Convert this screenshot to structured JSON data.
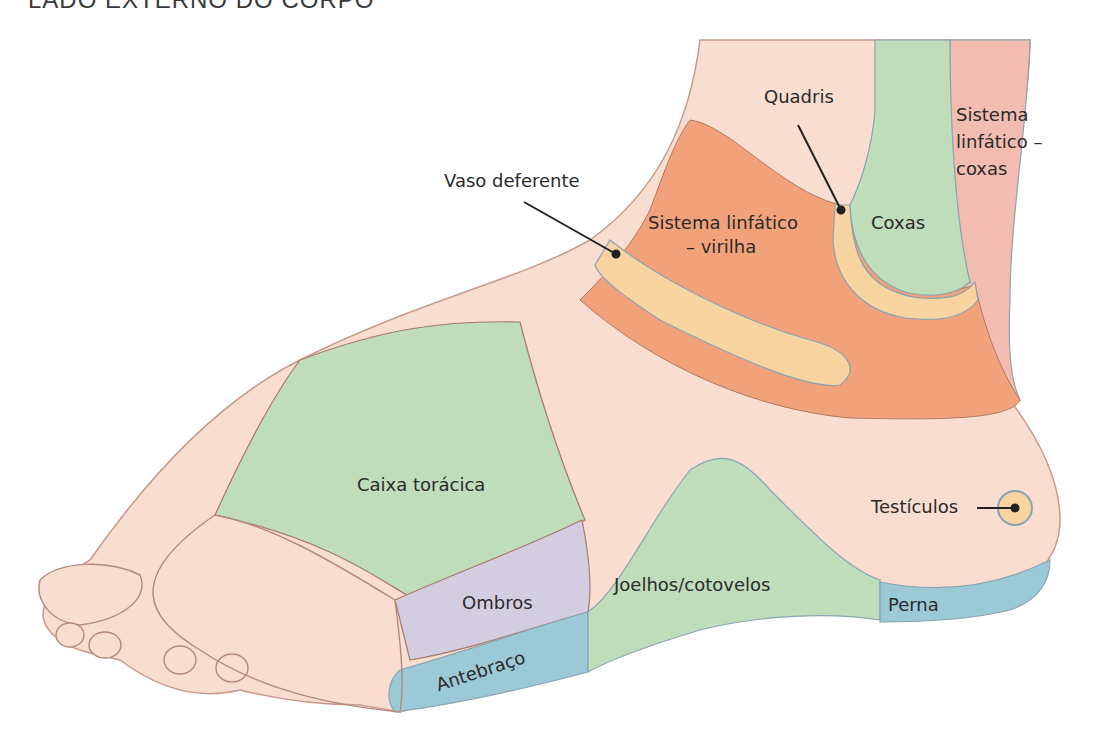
{
  "title": "LADO EXTERNO DO CORPO",
  "colors": {
    "skin": "#f8ddd0",
    "skin_outline": "#b58a7e",
    "orange": "#f1a27a",
    "yellow": "#f8d4a0",
    "green": "#bfdcbb",
    "pink": "#f2bcb1",
    "purple": "#d3cde2",
    "blue": "#9cc9d6",
    "border_blue": "#8aa4b0",
    "text": "#2b2b2b"
  },
  "labels": {
    "quadris": "Quadris",
    "sistema_coxas_1": "Sistema",
    "sistema_coxas_2": "linfático –",
    "sistema_coxas_3": "coxas",
    "vaso": "Vaso deferente",
    "sistema_virilha_1": "Sistema linfático",
    "sistema_virilha_2": "– virilha",
    "coxas": "Coxas",
    "caixa": "Caixa torácica",
    "testiculos": "Testículos",
    "ombros": "Ombros",
    "joelhos": "Joelhos/cotovelos",
    "perna": "Perna",
    "antebraco": "Antebraço"
  }
}
